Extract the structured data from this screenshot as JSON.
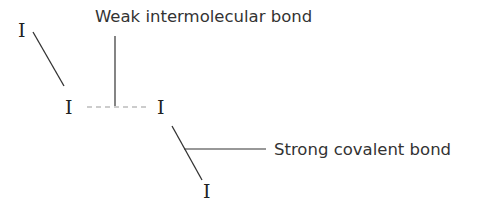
{
  "diagram": {
    "type": "molecular-structure",
    "atoms": [
      {
        "id": "a1",
        "symbol": "I",
        "x": 24,
        "y": 37
      },
      {
        "id": "a2",
        "symbol": "I",
        "x": 71,
        "y": 114
      },
      {
        "id": "a3",
        "symbol": "I",
        "x": 163,
        "y": 114
      },
      {
        "id": "a4",
        "symbol": "I",
        "x": 209,
        "y": 198
      }
    ],
    "bonds": [
      {
        "id": "covalent-1",
        "type": "covalent",
        "from": "a1",
        "to": "a2",
        "style": "solid"
      },
      {
        "id": "intermolecular-1",
        "type": "intermolecular",
        "from": "a2",
        "to": "a3",
        "style": "dashed"
      },
      {
        "id": "covalent-2",
        "type": "covalent",
        "from": "a3",
        "to": "a4",
        "style": "solid"
      }
    ],
    "labels": {
      "weak": "Weak intermolecular bond",
      "strong": "Strong covalent bond"
    },
    "colors": {
      "atom_text": "#222222",
      "label_text": "#333333",
      "solid_line": "#333333",
      "dashed_line": "#9a9a9a",
      "background": "#ffffff"
    }
  }
}
